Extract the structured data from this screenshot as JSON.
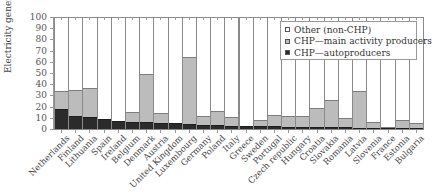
{
  "chart_data": {
    "type": "bar",
    "stacked": true,
    "title": "",
    "xlabel": "",
    "ylabel": "Electricity generation share (%)",
    "ylim": [
      0,
      100
    ],
    "yticks": [
      0,
      10,
      20,
      30,
      40,
      50,
      60,
      70,
      80,
      90,
      100
    ],
    "grid": false,
    "legend_position": "upper right (inside plot)",
    "categories": [
      "Netherlands",
      "Finland",
      "Lithuania",
      "Spain",
      "Ireland",
      "Belgium",
      "Denmark",
      "Austria",
      "United Kingdom",
      "Luxembourg",
      "Germany",
      "Poland",
      "Italy",
      "Greece",
      "Sweden",
      "Portugal",
      "Czech republic",
      "Hungary",
      "Croatia",
      "Slovakia",
      "Romania",
      "Latvia",
      "Slovenia",
      "France",
      "Estonia",
      "Bulgaria"
    ],
    "series": [
      {
        "name": "CHP—autoproducers",
        "color": "#2b2b2b",
        "values": [
          18,
          12,
          11,
          9,
          7.5,
          6.5,
          6,
          5.5,
          5,
          4.5,
          4,
          3.5,
          3,
          2.5,
          2.5,
          2.5,
          2,
          2,
          2,
          1.5,
          1.5,
          1,
          1,
          0.5,
          0.5,
          0.5
        ]
      },
      {
        "name": "CHP—main activity producers",
        "color": "#bcbcbc",
        "values": [
          16,
          23,
          25.5,
          0,
          0,
          9,
          43,
          9,
          0,
          59.5,
          8,
          12.5,
          8,
          0,
          5.5,
          10,
          10,
          10,
          16.5,
          24.5,
          8.5,
          33,
          5,
          1,
          8,
          4.5
        ]
      },
      {
        "name": "Other (non-CHP)",
        "color": "#ffffff",
        "values": [
          66,
          65,
          63.5,
          91,
          92.5,
          84.5,
          51,
          85.5,
          95,
          36,
          88,
          84,
          89,
          97.5,
          92,
          87.5,
          88,
          88,
          81.5,
          74,
          90,
          66,
          94,
          98.5,
          91.5,
          95
        ]
      }
    ]
  },
  "legend": {
    "items": [
      {
        "label": "Other (non-CHP)",
        "color": "#ffffff"
      },
      {
        "label": "CHP—main activity producers",
        "color": "#bcbcbc"
      },
      {
        "label": "CHP—autoproducers",
        "color": "#2b2b2b"
      }
    ]
  }
}
